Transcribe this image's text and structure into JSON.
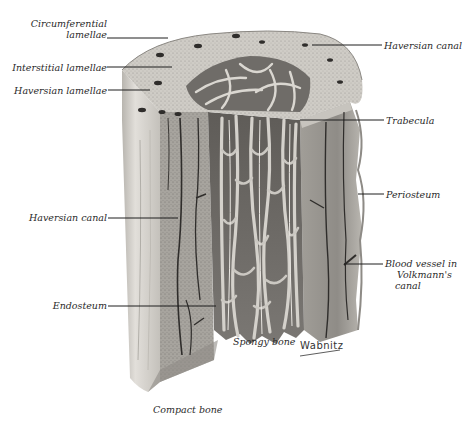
{
  "figure": {
    "signature": "Wabnitz"
  },
  "labels": {
    "circumferential_lamellae_1": "Circumferential",
    "circumferential_lamellae_2": "lamellae",
    "interstitial_lamellae": "Interstitial lamellae",
    "haversian_lamellae": "Haversian lamellae",
    "haversian_canal_top": "Haversian canal",
    "trabecula": "Trabecula",
    "periosteum": "Periosteum",
    "haversian_canal_left": "Haversian canal",
    "blood_vessel_1": "Blood vessel in",
    "blood_vessel_2": "Volkmann's",
    "blood_vessel_3": "canal",
    "endosteum": "Endosteum",
    "spongy_bone": "Spongy bone",
    "compact_bone": "Compact bone"
  },
  "colors": {
    "background": "#ffffff",
    "bone_light": "#d9d6d0",
    "bone_mid": "#a9a6a0",
    "bone_dark": "#6f6c68",
    "canal": "#2f2d2b",
    "leader": "#1e1e1e"
  }
}
